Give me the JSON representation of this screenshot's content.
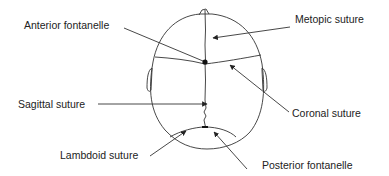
{
  "diagram": {
    "colors": {
      "line": "#333333",
      "text": "#222222",
      "background": "#ffffff"
    },
    "labels": {
      "anterior_fontanelle": "Anterior fontanelle",
      "metopic_suture": "Metopic suture",
      "sagittal_suture": "Sagittal suture",
      "coronal_suture": "Coronal suture",
      "lambdoid_suture": "Lambdoid suture",
      "posterior_fontanelle": "Posterior fontanelle"
    }
  }
}
